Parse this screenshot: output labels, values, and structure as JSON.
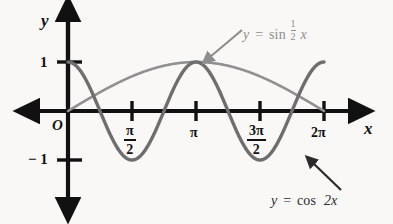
{
  "figure": {
    "background_color": "#f9f8f6",
    "width": 393,
    "height": 224
  },
  "axes": {
    "x_axis_label": "x",
    "y_axis_label": "y",
    "origin_label": "O",
    "axis_color": "#111111",
    "x_ticks": [
      {
        "label_num": "π",
        "label_den": "2",
        "kind": "fraction",
        "value": 1.5707963
      },
      {
        "label_num": "π",
        "label_den": "",
        "kind": "plain",
        "value": 3.1415927
      },
      {
        "label_num": "3π",
        "label_den": "2",
        "kind": "fraction",
        "value": 4.712389
      },
      {
        "label_num": "2π",
        "label_den": "",
        "kind": "plain",
        "value": 6.2831853
      }
    ],
    "y_ticks": [
      {
        "label": "1",
        "value": 1
      },
      {
        "label": "− 1",
        "value": -1
      }
    ]
  },
  "annotations": [
    {
      "id": "sin-label",
      "text_parts": {
        "lhs": "y",
        "eq": "=",
        "fn": "sin",
        "num": "1",
        "den": "2",
        "var": "x"
      },
      "plain_text": "y = sin 1/2 x",
      "color": "#8e8e8e",
      "arrow": {
        "from_x": 242,
        "from_y": 30,
        "to_x": 205,
        "to_y": 61
      }
    },
    {
      "id": "cos-label",
      "text_parts": {
        "lhs": "y",
        "eq": "=",
        "fn": "cos",
        "coef": "2",
        "var": "x"
      },
      "plain_text": "y = cos 2x",
      "color": "#2a2a2a",
      "arrow": {
        "from_x": 340,
        "from_y": 190,
        "to_x": 309,
        "to_y": 160
      }
    }
  ],
  "chart_data": {
    "type": "line",
    "title": "",
    "xlabel": "x",
    "ylabel": "y",
    "xlim": [
      -0.45,
      7.05
    ],
    "ylim": [
      -1.95,
      1.75
    ],
    "grid": false,
    "legend": "inline-annotations",
    "x_tick_values": [
      1.5707963,
      3.1415927,
      4.712389,
      6.2831853
    ],
    "x_tick_labels": [
      "π/2",
      "π",
      "3π/2",
      "2π"
    ],
    "y_tick_values": [
      1,
      -1
    ],
    "y_tick_labels": [
      "1",
      "− 1"
    ],
    "series": [
      {
        "name": "y = cos 2x",
        "expression": "cos(2x)",
        "color": "#6e6e6e",
        "width": 3.4,
        "domain": [
          0,
          6.2831853
        ],
        "amplitude": 1,
        "period": 3.1415927,
        "key_points": [
          {
            "x": 0,
            "y": 1
          },
          {
            "x": 0.7853982,
            "y": 0
          },
          {
            "x": 1.5707963,
            "y": -1
          },
          {
            "x": 2.3561945,
            "y": 0
          },
          {
            "x": 3.1415927,
            "y": 1
          },
          {
            "x": 3.9269908,
            "y": 0
          },
          {
            "x": 4.712389,
            "y": -1
          },
          {
            "x": 5.4977871,
            "y": 0
          },
          {
            "x": 6.2831853,
            "y": 1
          }
        ]
      },
      {
        "name": "y = sin 1/2 x",
        "expression": "sin(x/2)",
        "color": "#909090",
        "width": 2.6,
        "domain": [
          0,
          6.2831853
        ],
        "amplitude": 1,
        "period": 12.5663706,
        "key_points": [
          {
            "x": 0,
            "y": 0
          },
          {
            "x": 1.5707963,
            "y": 0.7071068
          },
          {
            "x": 3.1415927,
            "y": 1
          },
          {
            "x": 4.712389,
            "y": 0.7071068
          },
          {
            "x": 6.2831853,
            "y": 0
          }
        ]
      }
    ]
  },
  "geometry": {
    "origin_px": {
      "x": 68,
      "y": 111
    },
    "x_unit_px": 40.74,
    "y_unit_px": 49,
    "x_axis_start_px": 30,
    "x_axis_end_px": 360,
    "y_axis_top_px": 12,
    "y_axis_bottom_px": 207
  }
}
